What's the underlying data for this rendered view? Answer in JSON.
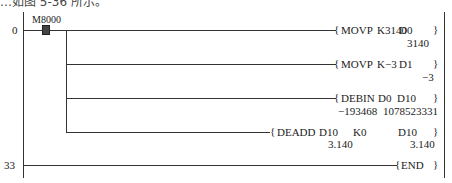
{
  "caption": "…如图 5-36 所示。",
  "ladder": {
    "step_numbers": [
      "0",
      "33"
    ],
    "contact": {
      "label": "M8000",
      "type": "normally-open (active)"
    },
    "rungs": [
      {
        "instruction": "MOVP",
        "op1": "K3140",
        "op2": "D0",
        "op1_value": "",
        "op2_value": "3140"
      },
      {
        "instruction": "MOVP",
        "op1": "K−3",
        "op2": "D1",
        "op1_value": "",
        "op2_value": "−3"
      },
      {
        "instruction": "DEBIN",
        "op1": "D0",
        "op2": "D10",
        "op1_value": "−193468",
        "op2_value": "1078523331"
      },
      {
        "instruction": "DEADD",
        "op1": "D10",
        "op1b": "K0",
        "op2": "D10",
        "op1_value": "3.140",
        "op2_value": "3.140"
      }
    ],
    "end": {
      "instruction": "END"
    },
    "bracket_open": "{",
    "bracket_close": "}"
  }
}
